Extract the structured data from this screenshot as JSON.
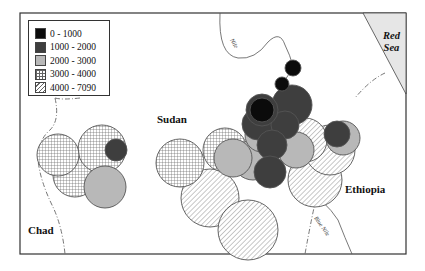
{
  "map": {
    "labels": {
      "sudan": "Sudan",
      "chad": "Chad",
      "ethiopia": "Ethiopia",
      "red_sea_line1": "Red",
      "red_sea_line2": "Sea",
      "nile": "Nile",
      "blue_nile": "Blue Nile"
    },
    "legend": {
      "items": [
        {
          "label": "0 - 1000",
          "fill": "black"
        },
        {
          "label": "1000 - 2000",
          "fill": "dark-gray"
        },
        {
          "label": "2000 - 3000",
          "fill": "light-gray"
        },
        {
          "label": "3000 - 4000",
          "fill": "grid-pattern"
        },
        {
          "label": "4000 - 7090",
          "fill": "diagonal-hatch"
        }
      ]
    },
    "colors": {
      "black": "#0b0b0b",
      "dark_gray": "#3e3e3e",
      "light_gray": "#b8b8b8",
      "sea": "#e6e6e6",
      "outline": "#444444"
    }
  }
}
